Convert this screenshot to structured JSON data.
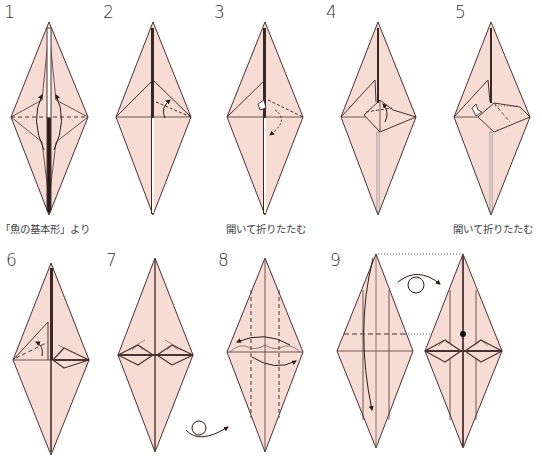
{
  "colors": {
    "paper": "#f7dcd6",
    "outline": "#4a3230",
    "crease": "#8a6a66",
    "background": "#ffffff"
  },
  "steps": [
    {
      "number": "1",
      "caption": "「魚の基本形」より"
    },
    {
      "number": "2",
      "caption": ""
    },
    {
      "number": "3",
      "caption": "開いて折りたたむ"
    },
    {
      "number": "4",
      "caption": ""
    },
    {
      "number": "5",
      "caption": "開いて折りたたむ"
    },
    {
      "number": "6",
      "caption": ""
    },
    {
      "number": "7",
      "caption": ""
    },
    {
      "number": "8",
      "caption": ""
    },
    {
      "number": "9",
      "caption": ""
    }
  ],
  "symbols": {
    "turn_over_step7": "turn-over-icon",
    "turn_over_step9": "turn-over-icon",
    "reference_dot_step9": "reference-dot"
  }
}
